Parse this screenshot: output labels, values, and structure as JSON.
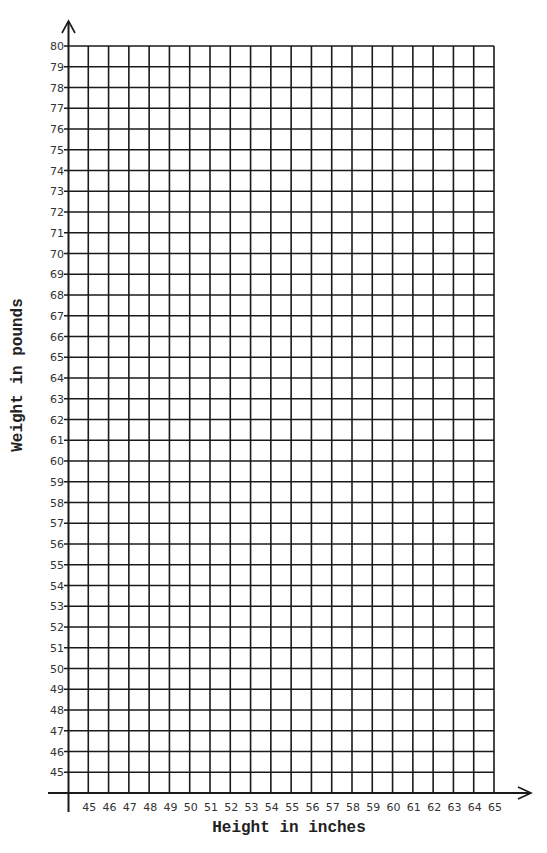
{
  "chart_data": {
    "type": "scatter",
    "title": "",
    "xlabel": "Height in inches",
    "ylabel": "Weight in pounds",
    "x_ticks": [
      45,
      46,
      47,
      48,
      49,
      50,
      51,
      52,
      53,
      54,
      55,
      56,
      57,
      58,
      59,
      60,
      61,
      62,
      63,
      64,
      65
    ],
    "y_ticks": [
      45,
      46,
      47,
      48,
      49,
      50,
      51,
      52,
      53,
      54,
      55,
      56,
      57,
      58,
      59,
      60,
      61,
      62,
      63,
      64,
      65,
      66,
      67,
      68,
      69,
      70,
      71,
      72,
      73,
      74,
      75,
      76,
      77,
      78,
      79,
      80
    ],
    "xlim": [
      44,
      65
    ],
    "ylim": [
      44,
      80
    ],
    "grid": true,
    "series": [],
    "note": "Blank graph-paper grid with no plotted data"
  },
  "colors": {
    "line": "#1a1a1a",
    "background": "#ffffff"
  },
  "layout": {
    "grid_left": 68,
    "grid_right": 494,
    "grid_top": 46,
    "grid_bottom": 793,
    "y_step": 20.75,
    "x_step": 20.29
  }
}
